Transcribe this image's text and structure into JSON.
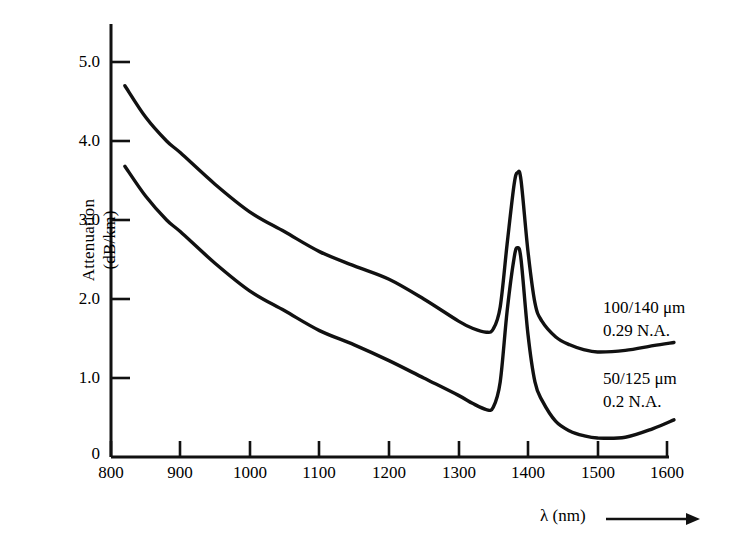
{
  "chart_data": {
    "type": "line",
    "title": "",
    "subtitle": "",
    "xlabel": "λ (nm)",
    "ylabel_line1": "Attenuation",
    "ylabel_line2": "(dB/km)",
    "xlim": [
      800,
      1600
    ],
    "ylim": [
      0,
      5.4
    ],
    "grid": false,
    "legend_position": "inline-right",
    "xticks": [
      800,
      900,
      1000,
      1100,
      1200,
      1300,
      1400,
      1500,
      1600
    ],
    "xtick_labels": [
      "800",
      "900",
      "1000",
      "1100",
      "1200",
      "1300",
      "1400",
      "1500",
      "1600"
    ],
    "yticks": [
      0,
      1.0,
      2.0,
      3.0,
      4.0,
      5.0
    ],
    "ytick_labels": [
      "0",
      "1.0",
      "2.0",
      "3.0",
      "4.0",
      "5.0"
    ],
    "axis_arrow": true,
    "series": [
      {
        "name": "100/140 μm 0.29 N.A.",
        "label_line1": "100/140 μm",
        "label_line2": "0.29 N.A.",
        "color": "#111111",
        "x": [
          820,
          850,
          880,
          900,
          950,
          1000,
          1050,
          1100,
          1150,
          1200,
          1250,
          1300,
          1320,
          1340,
          1350,
          1360,
          1370,
          1380,
          1385,
          1390,
          1400,
          1410,
          1420,
          1440,
          1460,
          1480,
          1500,
          1540,
          1580,
          1610
        ],
        "y": [
          4.7,
          4.3,
          4.0,
          3.85,
          3.45,
          3.1,
          2.85,
          2.6,
          2.42,
          2.25,
          2.0,
          1.72,
          1.63,
          1.58,
          1.62,
          1.9,
          2.7,
          3.45,
          3.6,
          3.5,
          2.6,
          1.95,
          1.72,
          1.52,
          1.42,
          1.36,
          1.33,
          1.35,
          1.41,
          1.45
        ]
      },
      {
        "name": "50/125 μm 0.2 N.A.",
        "label_line1": "50/125 μm",
        "label_line2": "0.2 N.A.",
        "color": "#111111",
        "x": [
          820,
          850,
          880,
          900,
          950,
          1000,
          1050,
          1100,
          1150,
          1200,
          1250,
          1300,
          1320,
          1340,
          1350,
          1360,
          1370,
          1380,
          1385,
          1390,
          1400,
          1410,
          1420,
          1440,
          1460,
          1480,
          1500,
          1540,
          1580,
          1610
        ],
        "y": [
          3.68,
          3.3,
          3.0,
          2.85,
          2.45,
          2.1,
          1.85,
          1.6,
          1.42,
          1.22,
          1.0,
          0.78,
          0.68,
          0.6,
          0.63,
          0.95,
          1.85,
          2.52,
          2.65,
          2.5,
          1.55,
          0.95,
          0.72,
          0.45,
          0.33,
          0.27,
          0.24,
          0.25,
          0.36,
          0.47
        ]
      }
    ]
  }
}
